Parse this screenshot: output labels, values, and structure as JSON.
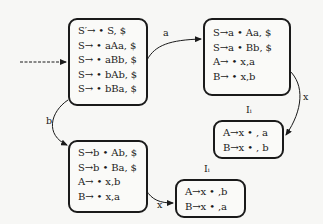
{
  "states": [
    {
      "id": "I0",
      "label": "",
      "items": [
        "S′→ • S, $",
        "S→ • aAa, $",
        "S→ • aBb, $",
        "S→ • bAb, $",
        "S→ • bBa, $"
      ]
    },
    {
      "id": "Ia",
      "label": "",
      "items": [
        "S→a • Aa, $",
        "S→a • Bb, $",
        "A→ • x,a",
        "B→ • x,b"
      ]
    },
    {
      "id": "Ib",
      "label": "",
      "items": [
        "S→b • Ab, $",
        "S→b • Ba, $",
        "A→ • x,b",
        "B→ • x,a"
      ]
    },
    {
      "id": "Iax",
      "label": "Iᵢ",
      "items": [
        "A→x • , a",
        "B→x • , b"
      ]
    },
    {
      "id": "Ibx",
      "label": "Iᵢ",
      "items": [
        "A→x • ,b",
        "B→x • ,a"
      ]
    }
  ],
  "edges": [
    {
      "from": "start",
      "to": "I0",
      "label": "",
      "style": "dashed"
    },
    {
      "from": "I0",
      "to": "Ia",
      "label": "a"
    },
    {
      "from": "I0",
      "to": "Ib",
      "label": "b"
    },
    {
      "from": "Ia",
      "to": "Iax",
      "label": "x"
    },
    {
      "from": "Ib",
      "to": "Ibx",
      "label": "x"
    }
  ]
}
